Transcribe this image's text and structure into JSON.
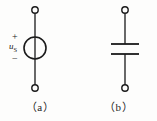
{
  "figure": {
    "background_color": "#fdfdfc",
    "stroke_color": "#1a1a1a",
    "width": 157,
    "height": 121
  },
  "panels": [
    {
      "id": "a",
      "caption": "（a）",
      "symbol_name": "ideal-voltage-source",
      "label": {
        "base": "u",
        "subscript": "S",
        "plus": "+",
        "minus": "−"
      },
      "geometry": {
        "terminal_top": {
          "cx": 35,
          "cy": 10,
          "r": 3.2
        },
        "terminal_bottom": {
          "cx": 35,
          "cy": 88,
          "r": 3.2
        },
        "circle": {
          "cx": 35,
          "cy": 48,
          "r": 11
        },
        "lead_top": {
          "x": 35,
          "y1": 13.2,
          "y2": 37
        },
        "lead_bottom": {
          "x": 35,
          "y1": 59,
          "y2": 84.8
        },
        "inner_line": {
          "x": 35,
          "y1": 37,
          "y2": 59
        }
      }
    },
    {
      "id": "b",
      "caption": "（b）",
      "symbol_name": "capacitor",
      "geometry": {
        "terminal_top": {
          "cx": 45,
          "cy": 10,
          "r": 3.2
        },
        "terminal_bottom": {
          "cx": 45,
          "cy": 88,
          "r": 3.2
        },
        "lead_top": {
          "x": 45,
          "y1": 13.2,
          "y2": 44
        },
        "lead_bottom": {
          "x": 45,
          "y1": 54,
          "y2": 84.8
        },
        "plate_upper": {
          "y": 44,
          "x1": 31,
          "x2": 59
        },
        "plate_lower": {
          "y": 54,
          "x1": 31,
          "x2": 59
        }
      }
    }
  ]
}
